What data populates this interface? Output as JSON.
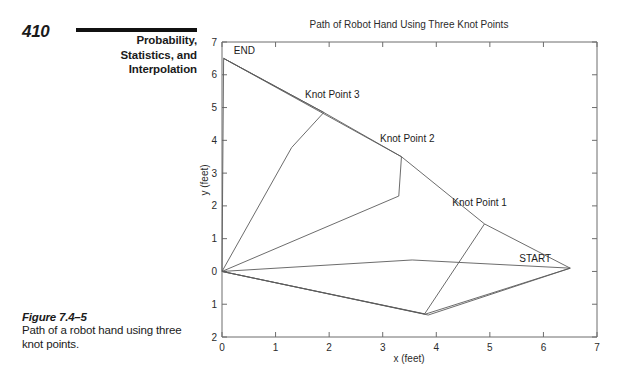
{
  "book": {
    "page_number": "410",
    "header_title_lines": [
      "Probability,",
      "Statistics, and",
      "Interpolation"
    ],
    "caption_label": "Figure 7.4–5",
    "caption_text": "Path of a robot hand using three knot points."
  },
  "chart_data": {
    "type": "line",
    "title": "Path of Robot Hand Using Three Knot Points",
    "xlabel": "x (feet)",
    "ylabel": "y (feet)",
    "xlim": [
      0,
      7
    ],
    "ylim": [
      -2,
      7
    ],
    "xticks": [
      0,
      1,
      2,
      3,
      4,
      5,
      6,
      7
    ],
    "xticklabels": [
      "0",
      "1",
      "2",
      "3",
      "4",
      "5",
      "6",
      "7"
    ],
    "yticks": [
      -2,
      -1,
      0,
      1,
      2,
      3,
      4,
      5,
      6,
      7
    ],
    "yticklabels": [
      "2",
      "1",
      "0",
      "1",
      "2",
      "3",
      "4",
      "5",
      "6",
      "7"
    ],
    "grid": false,
    "legend": "none",
    "annotations": [
      {
        "name": "start",
        "text": "START",
        "x": 5.55,
        "y": 0.3
      },
      {
        "name": "end",
        "text": "END",
        "x": 0.22,
        "y": 6.62
      },
      {
        "name": "knot1",
        "text": "Knot Point 1",
        "x": 4.3,
        "y": 2.0
      },
      {
        "name": "knot2",
        "text": "Knot Point 2",
        "x": 2.95,
        "y": 3.95
      },
      {
        "name": "knot3",
        "text": "Knot Point 3",
        "x": 1.55,
        "y": 5.3
      }
    ],
    "knot_points": [
      {
        "label": "START",
        "x": 6.5,
        "y": 0.1
      },
      {
        "label": "Knot Point 1",
        "x": 4.9,
        "y": 1.45
      },
      {
        "label": "Knot Point 2",
        "x": 3.35,
        "y": 3.5
      },
      {
        "label": "Knot Point 3",
        "x": 1.9,
        "y": 4.85
      },
      {
        "label": "END",
        "x": 0.03,
        "y": 6.5
      }
    ],
    "series": [
      {
        "name": "path-a",
        "points": [
          [
            6.5,
            0.1
          ],
          [
            4.9,
            1.45
          ],
          [
            3.35,
            3.5
          ],
          [
            1.9,
            4.85
          ],
          [
            0.03,
            6.5
          ]
        ]
      },
      {
        "name": "path-b",
        "points": [
          [
            6.5,
            0.1
          ],
          [
            3.8,
            -1.3
          ],
          [
            0.0,
            0.0
          ],
          [
            1.3,
            3.78
          ],
          [
            1.9,
            4.85
          ],
          [
            0.03,
            6.5
          ]
        ]
      },
      {
        "name": "path-c",
        "points": [
          [
            6.5,
            0.1
          ],
          [
            3.85,
            -1.33
          ],
          [
            0.0,
            0.0
          ],
          [
            3.3,
            2.3
          ],
          [
            3.35,
            3.5
          ],
          [
            0.03,
            6.5
          ]
        ]
      },
      {
        "name": "path-d",
        "points": [
          [
            4.9,
            1.45
          ],
          [
            3.78,
            -1.3
          ],
          [
            0.0,
            0.0
          ],
          [
            3.55,
            0.35
          ],
          [
            6.5,
            0.1
          ]
        ]
      },
      {
        "name": "path-e",
        "points": [
          [
            0.0,
            0.0
          ],
          [
            0.03,
            6.5
          ]
        ]
      }
    ]
  }
}
